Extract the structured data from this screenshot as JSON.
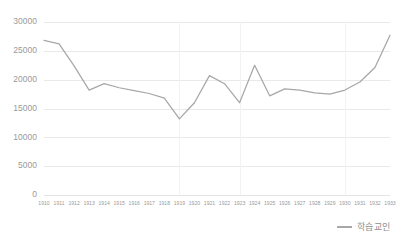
{
  "chart_data": {
    "type": "line",
    "title": "",
    "xlabel": "",
    "ylabel": "",
    "grid": true,
    "legend_position": "bottom-right",
    "ylim": [
      0,
      30000
    ],
    "yticks": [
      0,
      5000,
      10000,
      15000,
      20000,
      25000,
      30000
    ],
    "ytick_labels": [
      "0",
      "5000",
      "10000",
      "15000",
      "20000",
      "25000",
      "30000"
    ],
    "categories": [
      "1910",
      "1911",
      "1912",
      "1913",
      "1914",
      "1915",
      "1916",
      "1917",
      "1918",
      "1919",
      "1920",
      "1921",
      "1922",
      "1923",
      "1924",
      "1925",
      "1926",
      "1927",
      "1928",
      "1929",
      "1930",
      "1931",
      "1932",
      "1933"
    ],
    "vertical_gridlines_at": [
      "1919",
      "1923",
      "1930"
    ],
    "series": [
      {
        "name": "학습교인",
        "color": "#a7a7a7",
        "values": [
          26800,
          26200,
          22400,
          18200,
          19300,
          18600,
          18100,
          17600,
          16800,
          13200,
          16000,
          20700,
          19300,
          16000,
          22500,
          17200,
          18400,
          18200,
          17700,
          17500,
          18200,
          19600,
          22100,
          27700
        ]
      }
    ]
  },
  "legend": {
    "entries": [
      {
        "label": "학습교인"
      }
    ]
  }
}
